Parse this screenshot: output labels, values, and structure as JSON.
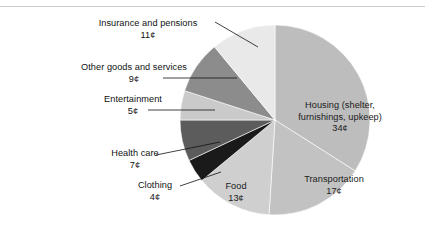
{
  "chart_data": {
    "type": "pie",
    "title": "",
    "subtitle": "",
    "xlabel": "",
    "ylabel": "",
    "legend_position": "none",
    "grid": false,
    "units": "cents per dollar",
    "total": 100,
    "start_angle_deg": 0,
    "direction": "clockwise",
    "categories": [
      "Housing (shelter, furnishings, upkeep)",
      "Transportation",
      "Food",
      "Clothing",
      "Health care",
      "Entertainment",
      "Other goods and services",
      "Insurance and pensions"
    ],
    "values": [
      34,
      17,
      13,
      4,
      7,
      5,
      9,
      11
    ],
    "value_labels": [
      "34¢",
      "17¢",
      "13¢",
      "4¢",
      "7¢",
      "5¢",
      "9¢",
      "11¢"
    ],
    "colors": [
      "#bdbdbd",
      "#c2c2c2",
      "#cfcfcf",
      "#1a1a1a",
      "#5c5c5c",
      "#cacaca",
      "#8c8c8c",
      "#e9e9e9"
    ],
    "slices": [
      {
        "name": "Housing (shelter, furnishings, upkeep)",
        "value": 34,
        "value_label": "34¢",
        "color": "#bdbdbd",
        "label_placement": "inside"
      },
      {
        "name": "Transportation",
        "value": 17,
        "value_label": "17¢",
        "color": "#c2c2c2",
        "label_placement": "inside"
      },
      {
        "name": "Food",
        "value": 13,
        "value_label": "13¢",
        "color": "#cfcfcf",
        "label_placement": "inside"
      },
      {
        "name": "Clothing",
        "value": 4,
        "value_label": "4¢",
        "color": "#1a1a1a",
        "label_placement": "callout"
      },
      {
        "name": "Health care",
        "value": 7,
        "value_label": "7¢",
        "color": "#5c5c5c",
        "label_placement": "callout"
      },
      {
        "name": "Entertainment",
        "value": 5,
        "value_label": "5¢",
        "color": "#cacaca",
        "label_placement": "callout"
      },
      {
        "name": "Other goods and services",
        "value": 9,
        "value_label": "9¢",
        "color": "#8c8c8c",
        "label_placement": "callout"
      },
      {
        "name": "Insurance and pensions",
        "value": 11,
        "value_label": "11¢",
        "color": "#e9e9e9",
        "label_placement": "callout"
      }
    ]
  },
  "labels": {
    "insurance": {
      "name": "Insurance and pensions",
      "value": "11¢"
    },
    "other_goods": {
      "name": "Other goods and services",
      "value": "9¢"
    },
    "entertainment": {
      "name": "Entertainment",
      "value": "5¢"
    },
    "health_care": {
      "name": "Health care",
      "value": "7¢"
    },
    "clothing": {
      "name": "Clothing",
      "value": "4¢"
    },
    "housing": {
      "line1": "Housing (shelter,",
      "line2": "furnishings, upkeep)",
      "value": "34¢"
    },
    "transportation": {
      "name": "Transportation",
      "value": "17¢"
    },
    "food": {
      "name": "Food",
      "value": "13¢"
    }
  }
}
